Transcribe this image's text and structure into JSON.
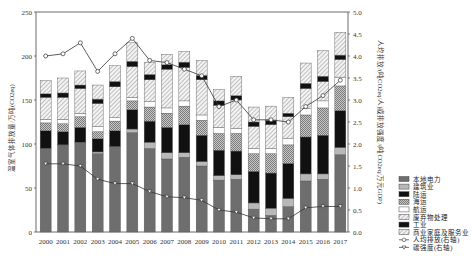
{
  "chart_data": {
    "type": "bar",
    "stacked": true,
    "title": "",
    "xlabel": "",
    "ylabel": "温室气体排放量/万吨(CO2eq)",
    "ylabel_right": "人均排放/(吨CO2eq/人)或排放强度/(吨CO2eq/万元GDP)",
    "ylim": [
      0,
      250
    ],
    "ylim_right": [
      0,
      5.0
    ],
    "yticks": [
      0,
      50,
      100,
      150,
      200,
      250
    ],
    "yticks_right": [
      "0.0",
      "0.5",
      "1.0",
      "1.5",
      "2.0",
      "2.5",
      "3.0",
      "3.5",
      "4.0",
      "4.5",
      "5.0"
    ],
    "grid": false,
    "legend_position": "right",
    "categories": [
      "2000",
      "2001",
      "2002",
      "2003",
      "2004",
      "2005",
      "2006",
      "2007",
      "2008",
      "2009",
      "2010",
      "2011",
      "2012",
      "2013",
      "2014",
      "2015",
      "2016",
      "2017"
    ],
    "series": [
      {
        "name": "本地电力",
        "pattern": "dark-gray",
        "values": [
          95,
          99,
          102,
          89,
          97,
          113,
          95,
          83,
          85,
          75,
          59,
          60,
          26,
          19,
          29,
          58,
          60,
          88
        ]
      },
      {
        "name": "建筑业",
        "pattern": "light-gray",
        "values": [
          0,
          0,
          0,
          2,
          0,
          4,
          7,
          7,
          5,
          5,
          5,
          5,
          7,
          8,
          9,
          8,
          6,
          8
        ]
      },
      {
        "name": "陆运",
        "pattern": "black",
        "values": [
          20,
          15,
          17,
          15,
          18,
          22,
          24,
          29,
          32,
          30,
          29,
          27,
          36,
          40,
          40,
          42,
          44,
          42
        ]
      },
      {
        "name": "海运",
        "pattern": "cross-hatch",
        "values": [
          9,
          9,
          12,
          8,
          11,
          10,
          16,
          16,
          21,
          17,
          19,
          20,
          20,
          22,
          21,
          25,
          31,
          28
        ]
      },
      {
        "name": "航运",
        "pattern": "white",
        "values": [
          4,
          5,
          4,
          6,
          4,
          4,
          6,
          6,
          6,
          6,
          7,
          6,
          6,
          6,
          7,
          7,
          8,
          10
        ]
      },
      {
        "name": "废弃物处理",
        "pattern": "hatched",
        "values": [
          25,
          25,
          28,
          26,
          35,
          35,
          25,
          44,
          38,
          40,
          25,
          32,
          25,
          27,
          25,
          23,
          22,
          20
        ]
      },
      {
        "name": "工业",
        "pattern": "black",
        "values": [
          4,
          5,
          4,
          5,
          6,
          6,
          6,
          5,
          6,
          5,
          5,
          5,
          5,
          5,
          4,
          6,
          6,
          5
        ]
      },
      {
        "name": "商业家庭及服务业",
        "pattern": "hatched",
        "values": [
          15,
          17,
          16,
          16,
          18,
          21,
          14,
          12,
          12,
          17,
          13,
          22,
          17,
          16,
          18,
          23,
          29,
          26
        ]
      }
    ],
    "line_series": [
      {
        "name": "人均排放(右轴)",
        "axis": "right",
        "marker": "circle",
        "values": [
          4.0,
          4.05,
          4.3,
          3.65,
          4.05,
          4.4,
          3.9,
          3.85,
          3.7,
          3.55,
          2.85,
          3.0,
          2.55,
          2.55,
          2.5,
          2.85,
          3.1,
          3.45
        ]
      },
      {
        "name": "碳强度(右轴)",
        "axis": "right",
        "marker": "triangle",
        "values": [
          1.55,
          1.55,
          1.5,
          1.2,
          1.1,
          1.1,
          0.92,
          0.8,
          0.78,
          0.72,
          0.5,
          0.45,
          0.32,
          0.3,
          0.3,
          0.55,
          0.58,
          0.58
        ]
      }
    ]
  },
  "legend": {
    "items": [
      {
        "label": "本地电力",
        "swatch": "dark-gray"
      },
      {
        "label": "建筑业",
        "swatch": "light-gray"
      },
      {
        "label": "陆运",
        "swatch": "black"
      },
      {
        "label": "海运",
        "swatch": "cross-hatch"
      },
      {
        "label": "航运",
        "swatch": "white"
      },
      {
        "label": "废弃物处理",
        "swatch": "hatched"
      },
      {
        "label": "工业",
        "swatch": "black"
      },
      {
        "label": "商业家庭及服务业",
        "swatch": "hatched"
      },
      {
        "label": "人均排放(右轴)",
        "swatch": "line-circle"
      },
      {
        "label": "碳强度(右轴)",
        "swatch": "line-triangle"
      }
    ]
  },
  "colors": {
    "dark-gray": "#6e6e6e",
    "light-gray": "#b8b8b8",
    "black": "#111111",
    "white": "#ffffff",
    "stroke": "#555555",
    "line": "#333333"
  }
}
